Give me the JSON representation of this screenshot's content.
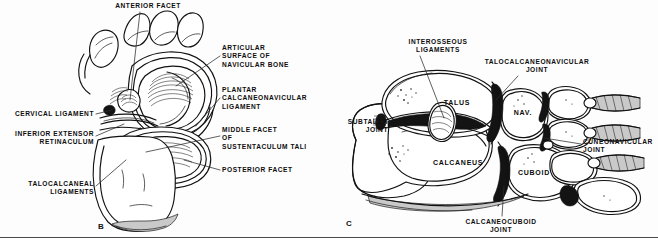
{
  "figure": {
    "caption_letters": {
      "panel_b": "B",
      "panel_c": "C"
    }
  },
  "panel_b": {
    "letter": "B",
    "labels": [
      {
        "id": "anterior-facet",
        "text": "ANTERIOR FACET",
        "align": "center",
        "x": 88,
        "y": 2,
        "w": 120
      },
      {
        "id": "articular-surface",
        "text": "ARTICULAR\nSURFACE OF\nNAVICULAR BONE",
        "align": "left",
        "x": 222,
        "y": 44,
        "w": 104
      },
      {
        "id": "plantar-ligament",
        "text": "PLANTAR\nCALCANEONAVICULAR\nLIGAMENT",
        "align": "left",
        "x": 222,
        "y": 86,
        "w": 104
      },
      {
        "id": "middle-facet",
        "text": "MIDDLE FACET\nOF\nSUSTENTACULUM TALI",
        "align": "left",
        "x": 222,
        "y": 126,
        "w": 104
      },
      {
        "id": "posterior-facet",
        "text": "POSTERIOR FACET",
        "align": "left",
        "x": 222,
        "y": 166,
        "w": 104
      },
      {
        "id": "cervical-ligament",
        "text": "CERVICAL LIGAMENT",
        "align": "right",
        "x": 2,
        "y": 110,
        "w": 92
      },
      {
        "id": "inferior-extensor",
        "text": "INFERIOR EXTENSOR\nRETINACULUM",
        "align": "right",
        "x": 2,
        "y": 130,
        "w": 92
      },
      {
        "id": "talocalcaneal-ligaments",
        "text": "TALOCALCANEAL\nLIGAMENTS",
        "align": "right",
        "x": 2,
        "y": 180,
        "w": 92
      }
    ]
  },
  "panel_c": {
    "letter": "C",
    "labels": [
      {
        "id": "interosseous-ligaments",
        "text": "INTEROSSEOUS\nLIGAMENTS",
        "align": "center",
        "x": 396,
        "y": 38,
        "w": 84
      },
      {
        "id": "talocalcaneonavicular",
        "text": "TALOCALCANEONAVICULAR\nJOINT",
        "align": "center",
        "x": 476,
        "y": 58,
        "w": 122
      },
      {
        "id": "subtalar-joint",
        "text": "SUBTALAR\nJOINT",
        "align": "right",
        "x": 332,
        "y": 118,
        "w": 56
      },
      {
        "id": "cuneonavicular-joint",
        "text": "CUNEONAVICULAR\nJOINT",
        "align": "left",
        "x": 583,
        "y": 138,
        "w": 74
      },
      {
        "id": "calcaneocuboid-joint",
        "text": "CALCANEOCUBOID\nJOINT",
        "align": "center",
        "x": 440,
        "y": 218,
        "w": 122
      }
    ],
    "bone_labels": [
      {
        "id": "talus",
        "text": "TALUS",
        "x": 434,
        "y": 99,
        "w": 46
      },
      {
        "id": "navicular",
        "text": "NAV.",
        "x": 508,
        "y": 109,
        "w": 30
      },
      {
        "id": "calcaneus",
        "text": "CALCANEUS",
        "x": 424,
        "y": 159,
        "w": 68
      },
      {
        "id": "cuboid",
        "text": "CUBOID",
        "x": 510,
        "y": 169,
        "w": 48
      }
    ]
  },
  "colors": {
    "ink": "#111111",
    "paper": "#fdfdfd",
    "cartilage_dark": "#131313",
    "cartilage_grey": "#c9c9c9"
  }
}
